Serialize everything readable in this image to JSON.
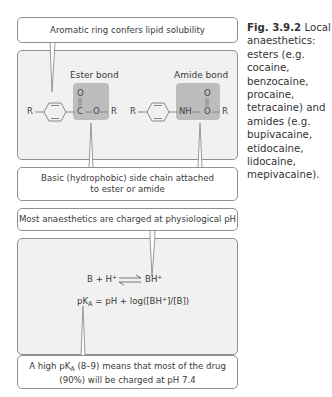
{
  "figure": {
    "caption_label": "Fig. 3.9.2",
    "caption_text": "Local anaesthetics: esters (e.g. cocaine, benzocaine, procaine, tetracaine) and amides (e.g. bupivacaine, etidocaine, lidocaine, mepivacaine).",
    "structure_section": {
      "top_callout": "Aromatic ring confers lipid solubility",
      "ester": {
        "title": "Ester bond",
        "left_r": "R",
        "carbonyl_o": "O",
        "carbon": "C",
        "ester_o": "O",
        "right_r": "R"
      },
      "amide": {
        "title": "Amide bond",
        "left_r": "R",
        "nh": "NH",
        "carbonyl_o": "O",
        "o": "O",
        "right_r": "R"
      },
      "bottom_callout_line1": "Basic (hydrophobic) side chain attached",
      "bottom_callout_line2": "to ester or amide"
    },
    "equilibrium_section": {
      "top_callout": "Most anaesthetics are charged at physiological pH",
      "reaction_left": "B + H",
      "reaction_left_sup": "+",
      "reaction_right": "BH",
      "reaction_right_sup": "+",
      "equation_p": "pK",
      "equation_sub": "A",
      "equation_rest": " = pH + log([BH",
      "equation_sup": "+",
      "equation_end": "]/[B])",
      "bottom_callout_line1_a": "A high pK",
      "bottom_callout_line1_sub": "A",
      "bottom_callout_line1_b": " (8–9) means that most of the drug",
      "bottom_callout_line2": "(90%) will be charged at pH 7.4"
    },
    "colors": {
      "panel_bg": "#f1f1f1",
      "bond_box": "#bdbdbd",
      "border": "#8f8f8f"
    }
  }
}
